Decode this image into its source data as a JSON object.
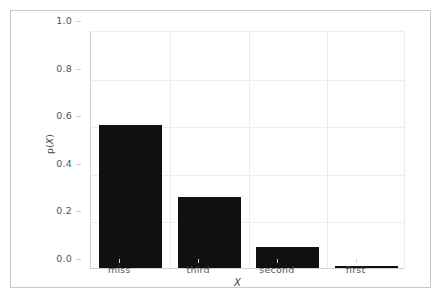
{
  "figure": {
    "background_color": "#ffffff",
    "frame_color": "#c9c9c9",
    "axes_color": "#d0d0d0",
    "grid_color": "#ededed",
    "tick_text_color": "#555555",
    "label_text_color": "#444444",
    "bar_color": "#101010"
  },
  "chart_data": {
    "type": "bar",
    "title": "",
    "xlabel": "X",
    "ylabel": "p(X)",
    "categories": [
      "miss",
      "third",
      "second",
      "first"
    ],
    "values": [
      0.6,
      0.3,
      0.09,
      0.01
    ],
    "ylim": [
      0.0,
      1.0
    ],
    "yticks": [
      0.0,
      0.2,
      0.4,
      0.6,
      0.8,
      1.0
    ],
    "ytick_labels": [
      "0.0",
      "0.2",
      "0.4",
      "0.6",
      "0.8",
      "1.0"
    ],
    "xtick_labels": [
      "miss",
      "third",
      "second",
      "first"
    ],
    "grid": true,
    "legend": null,
    "series": [
      {
        "name": "p(X)",
        "values": [
          0.6,
          0.3,
          0.09,
          0.01
        ],
        "color": "#101010"
      }
    ]
  },
  "axis": {
    "ylabel_prefix": "p(",
    "ylabel_var": "X",
    "ylabel_suffix": ")",
    "xlabel_text": "X"
  }
}
